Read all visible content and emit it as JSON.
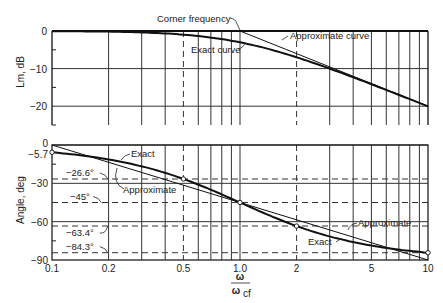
{
  "chart_data": [
    {
      "type": "line",
      "title": "",
      "xlabel": "ω / ω_cf",
      "ylabel": "Lm, dB",
      "xscale": "log",
      "xlim": [
        0.1,
        10
      ],
      "ylim": [
        -25,
        0
      ],
      "x_ticks": [
        0.1,
        0.2,
        0.5,
        1.0,
        2,
        5,
        10
      ],
      "y_ticks": [
        0,
        -10,
        -20
      ],
      "y_tick_labels": [
        "0",
        "−10",
        "−20"
      ],
      "grid": true,
      "series": [
        {
          "name": "Exact curve",
          "x": [
            0.1,
            0.2,
            0.3,
            0.5,
            0.7,
            1.0,
            1.5,
            2,
            3,
            5,
            7,
            10
          ],
          "y": [
            -0.04,
            -0.17,
            -0.37,
            -0.97,
            -1.7,
            -3.01,
            -5.12,
            -6.99,
            -10.0,
            -14.15,
            -16.99,
            -20.04
          ]
        },
        {
          "name": "Approximate curve",
          "x": [
            0.1,
            1.0,
            10
          ],
          "y": [
            0,
            0,
            -20
          ]
        }
      ],
      "annotations": [
        {
          "text": "Corner frequency",
          "x": 1.0
        },
        {
          "text": "Exact curve"
        },
        {
          "text": "Approximate curve"
        }
      ]
    },
    {
      "type": "line",
      "title": "",
      "xlabel": "ω / ω_cf",
      "ylabel": "Angle, deg",
      "xscale": "log",
      "xlim": [
        0.1,
        10
      ],
      "ylim": [
        -90,
        0
      ],
      "x_ticks": [
        0.1,
        0.2,
        0.5,
        1.0,
        2,
        5,
        10
      ],
      "x_tick_labels": [
        "0.1",
        "0.2",
        "0.5",
        "1.0",
        "2",
        "5",
        "10"
      ],
      "y_ticks": [
        0,
        -5.7,
        -30,
        -60,
        -90
      ],
      "y_tick_labels": [
        "0",
        "−5.7",
        "−30",
        "−60",
        "−90"
      ],
      "grid": true,
      "reference_lines": [
        -26.6,
        -45,
        -63.4,
        -84.3
      ],
      "reference_labels": [
        "−26.6°",
        "−45°",
        "−63.4°",
        "−84.3°"
      ],
      "series": [
        {
          "name": "Exact",
          "x": [
            0.1,
            0.2,
            0.3,
            0.5,
            0.7,
            1.0,
            1.5,
            2,
            3,
            5,
            7,
            10
          ],
          "y": [
            -5.7,
            -11.3,
            -16.7,
            -26.6,
            -35.0,
            -45.0,
            -56.3,
            -63.4,
            -71.6,
            -78.7,
            -81.9,
            -84.3
          ]
        },
        {
          "name": "Approximate",
          "x": [
            0.1,
            10
          ],
          "y": [
            0,
            -90
          ]
        }
      ],
      "marked_points": [
        {
          "x": 0.1,
          "y": -5.7
        },
        {
          "x": 0.5,
          "y": -26.6
        },
        {
          "x": 1.0,
          "y": -45
        },
        {
          "x": 2,
          "y": -63.4
        },
        {
          "x": 10,
          "y": -84.3
        }
      ],
      "annotations": [
        {
          "text": "Exact"
        },
        {
          "text": "Approximate"
        },
        {
          "text": "Approximate"
        },
        {
          "text": "Exact"
        }
      ]
    }
  ],
  "labels": {
    "mag_ylabel": "Lm, dB",
    "ang_ylabel": "Angle, deg",
    "x_num": "ω",
    "x_den": "ω",
    "x_den_sub": "cf",
    "corner": "Corner frequency",
    "exact_curve": "Exact curve",
    "approx_curve": "Approximate curve",
    "exact_top": "Exact",
    "approx_top": "Approximate",
    "approx_bottom": "Approximate",
    "exact_bottom": "Exact"
  }
}
